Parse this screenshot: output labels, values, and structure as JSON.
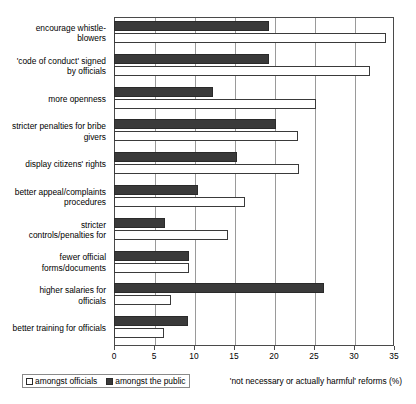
{
  "chart_data": {
    "type": "bar",
    "orientation": "horizontal",
    "title": "",
    "xlabel": "'not necessary or actually harmful' reforms (%)",
    "ylabel": "",
    "xlim": [
      0,
      35
    ],
    "xticks": [
      0,
      5,
      10,
      15,
      20,
      25,
      30,
      35
    ],
    "xtick_labels": [
      "0",
      "5",
      "10",
      "15",
      "20",
      "25",
      "30",
      "35"
    ],
    "grid": true,
    "grid_axis": "x",
    "legend_position": "bottom-left",
    "categories": [
      "encourage whistle-\nblowers",
      "'code of conduct' signed\nby officials",
      "more openness",
      "stricter penalties for bribe\ngivers",
      "display citizens' rights",
      "better appeal/complaints\nprocedures",
      "stricter\ncontrols/penalties for",
      "fewer official\nforms/documents",
      "higher salaries for\nofficials",
      "better training for officials"
    ],
    "series": [
      {
        "name": "amongst officials",
        "color": "#ffffff",
        "edge_color": "#3a3a3a",
        "values": [
          34,
          32,
          25.3,
          23,
          23.1,
          16.4,
          14.2,
          9.4,
          7.1,
          6.2
        ]
      },
      {
        "name": "amongst the public",
        "color": "#3a3a3a",
        "edge_color": "#2a2a2a",
        "values": [
          19.4,
          19.4,
          12.4,
          20.3,
          15.4,
          10.5,
          6.4,
          9.4,
          26.3,
          9.3
        ]
      }
    ]
  },
  "legend": {
    "items": [
      {
        "label": "amongst officials"
      },
      {
        "label": "amongst the public"
      }
    ]
  },
  "axis": {
    "x_title": "'not necessary or actually harmful' reforms (%)"
  }
}
